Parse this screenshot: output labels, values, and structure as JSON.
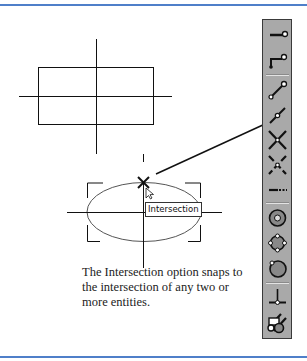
{
  "figure": {
    "caption": "The Intersection option snaps to the intersection of any two or more entities.",
    "tooltip": "Intersection",
    "colors": {
      "rule": "#4f7fc9",
      "toolbar_bg": "#a9a9a9",
      "line": "#111111"
    }
  },
  "toolbar": {
    "orientation": "vertical",
    "items": [
      {
        "name": "endpoint-snap",
        "icon": "line-endpoint-icon"
      },
      {
        "name": "endpoint-polyline-snap",
        "icon": "polyline-endpoint-icon"
      },
      {
        "name": "separator"
      },
      {
        "name": "endpoint-line-snap",
        "icon": "line-endpoints-icon"
      },
      {
        "name": "midpoint-snap",
        "icon": "midpoint-icon"
      },
      {
        "name": "intersection-snap",
        "icon": "intersection-icon",
        "active": true
      },
      {
        "name": "apparent-intersection-snap",
        "icon": "apparent-intersection-icon"
      },
      {
        "name": "extension-snap",
        "icon": "extension-icon"
      },
      {
        "name": "separator"
      },
      {
        "name": "center-snap",
        "icon": "center-icon"
      },
      {
        "name": "quadrant-snap",
        "icon": "quadrant-icon"
      },
      {
        "name": "tangent-snap",
        "icon": "tangent-icon"
      },
      {
        "name": "separator"
      },
      {
        "name": "perpendicular-snap",
        "icon": "perpendicular-icon"
      },
      {
        "name": "parallel-snap",
        "icon": "parallel-icon"
      },
      {
        "name": "snap-settings",
        "icon": "snap-settings-icon"
      }
    ]
  }
}
